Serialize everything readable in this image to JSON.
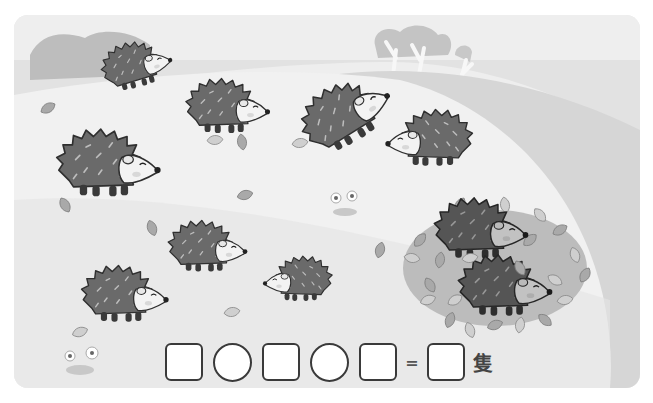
{
  "scene": {
    "description": "Hedgehogs on an autumn hillside; count them",
    "hedgehog_count_on_grass": 9,
    "hedgehog_count_in_leaf_pile": 2,
    "colors": {
      "background": "#e6e6e6",
      "hill": "#f0f0f0",
      "far_hill": "#d4d4d4",
      "hedgehog_body": "#6a6a6a",
      "hedgehog_body_dark": "#4a4a4a",
      "hedgehog_face": "#f3f3f3",
      "outline": "#2f2f2f",
      "leaf": "#a9a9a9"
    }
  },
  "equation": {
    "slots": [
      {
        "type": "box",
        "value": ""
      },
      {
        "type": "circle",
        "value": ""
      },
      {
        "type": "box",
        "value": ""
      },
      {
        "type": "circle",
        "value": ""
      },
      {
        "type": "box",
        "value": ""
      }
    ],
    "equals": "=",
    "answer_value": "",
    "unit": "隻"
  }
}
